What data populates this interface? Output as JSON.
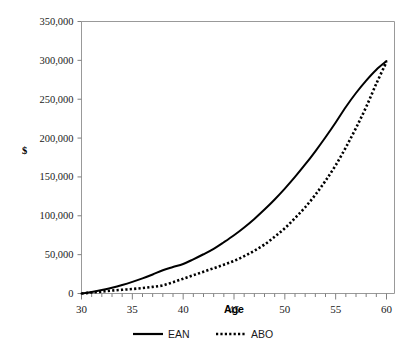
{
  "chart_data": {
    "type": "line",
    "title": "",
    "xlabel": "Age",
    "ylabel": "$",
    "xlim": [
      30,
      60
    ],
    "ylim": [
      0,
      350000
    ],
    "grid": false,
    "legend_position": "bottom",
    "x_ticks_major": [
      30,
      35,
      40,
      45,
      50,
      55,
      60
    ],
    "x_tick_labels": [
      "30",
      "35",
      "40",
      "45",
      "50",
      "55",
      "60"
    ],
    "x_minor_tick_step": 1,
    "y_ticks": [
      0,
      50000,
      100000,
      150000,
      200000,
      250000,
      300000,
      350000
    ],
    "y_tick_labels": [
      "0",
      "50,000",
      "100,000",
      "150,000",
      "200,000",
      "250,000",
      "300,000",
      "350,000"
    ],
    "x": [
      30,
      31,
      32,
      33,
      34,
      35,
      36,
      37,
      38,
      39,
      40,
      41,
      42,
      43,
      44,
      45,
      46,
      47,
      48,
      49,
      50,
      51,
      52,
      53,
      54,
      55,
      56,
      57,
      58,
      59,
      60
    ],
    "series": [
      {
        "name": "EAN",
        "style": "solid",
        "color": "#000000",
        "values": [
          0,
          2000,
          4500,
          7500,
          11000,
          15000,
          19500,
          24500,
          30000,
          34000,
          38000,
          44000,
          50500,
          57500,
          66000,
          75000,
          85000,
          96000,
          108000,
          121000,
          135000,
          150000,
          166000,
          183000,
          201000,
          220000,
          240000,
          258000,
          274000,
          288000,
          299000
        ]
      },
      {
        "name": "ABO",
        "style": "dotted",
        "color": "#000000",
        "values": [
          0,
          1200,
          2500,
          3800,
          4800,
          5800,
          7000,
          8500,
          10500,
          14500,
          19000,
          23500,
          28000,
          32500,
          37000,
          42000,
          48000,
          55000,
          63000,
          73000,
          84000,
          97000,
          111000,
          127000,
          145000,
          165000,
          188000,
          213000,
          240000,
          270000,
          298000
        ]
      }
    ],
    "legend": [
      {
        "label": "EAN",
        "style": "solid"
      },
      {
        "label": "ABO",
        "style": "dotted"
      }
    ]
  }
}
